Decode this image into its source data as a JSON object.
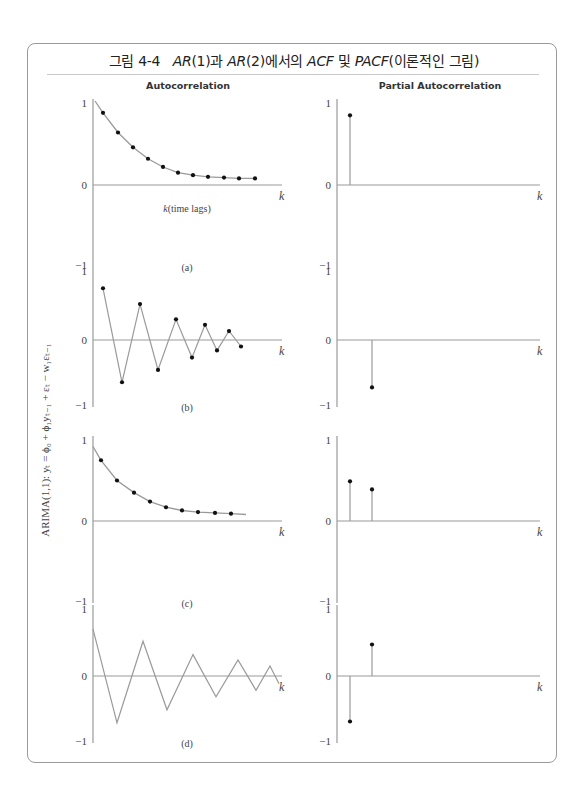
{
  "figure": {
    "title_prefix": "그림 4-4",
    "title_parts": [
      "AR",
      "(1)과 ",
      "AR",
      "(2)에서의 ",
      "ACF",
      " 및 ",
      "PACF",
      "(이론적인 그림)"
    ],
    "column_headers": [
      "Autocorrelation",
      "Partial Autocorrelation"
    ],
    "side_label": "ARIMA(1,1): yₜ = ϕ₀ + ϕ₁yₜ₋₁ + εₜ − w₁εₜ₋₁",
    "x_axis_label": "k(time lags)",
    "k_label": "k",
    "colors": {
      "line": "#9a9a9a",
      "dot": "#111111",
      "axis": "#9a9a9a",
      "frame": "#9a9a9a"
    }
  },
  "chart_data": [
    {
      "panel": "(a)",
      "column": "Autocorrelation",
      "type": "line",
      "x": [
        1,
        2,
        3,
        4,
        5,
        6,
        7,
        8,
        9,
        10,
        11
      ],
      "values": [
        0.88,
        0.64,
        0.46,
        0.32,
        0.22,
        0.15,
        0.12,
        0.1,
        0.09,
        0.08,
        0.08
      ],
      "markers": true,
      "ylim": [
        -1,
        1
      ],
      "yticks": [
        "1",
        "0",
        "-1"
      ],
      "xlabel": "k(time lags)",
      "caption": "(a)"
    },
    {
      "panel": "(a)",
      "column": "Partial Autocorrelation",
      "type": "stem",
      "x": [
        1
      ],
      "values": [
        0.85
      ],
      "ylim": [
        -1,
        1
      ],
      "yticks": [
        "1",
        "0",
        "-1"
      ]
    },
    {
      "panel": "(b)",
      "column": "Autocorrelation",
      "type": "line",
      "x": [
        1,
        2,
        3,
        4,
        5,
        6,
        7,
        8,
        9,
        10
      ],
      "values": [
        0.75,
        -0.65,
        0.52,
        -0.46,
        0.3,
        -0.27,
        0.22,
        -0.16,
        0.13,
        -0.1
      ],
      "markers": true,
      "ylim": [
        -1,
        1
      ],
      "yticks": [
        "1",
        "0",
        "-1"
      ],
      "caption": "(b)"
    },
    {
      "panel": "(b)",
      "column": "Partial Autocorrelation",
      "type": "stem",
      "x": [
        2
      ],
      "values": [
        -0.73
      ],
      "ylim": [
        -1,
        1
      ],
      "yticks": [
        "1",
        "0",
        "-1"
      ]
    },
    {
      "panel": "(c)",
      "column": "Autocorrelation",
      "type": "line",
      "x": [
        1,
        2,
        3,
        4,
        5,
        6,
        7,
        8,
        9
      ],
      "values": [
        0.75,
        0.5,
        0.35,
        0.24,
        0.17,
        0.13,
        0.11,
        0.1,
        0.09
      ],
      "markers": true,
      "ylim": [
        -1,
        1
      ],
      "yticks": [
        "1",
        "0",
        "-1"
      ],
      "caption": "(c)"
    },
    {
      "panel": "(c)",
      "column": "Partial Autocorrelation",
      "type": "stem",
      "x": [
        1,
        2
      ],
      "values": [
        0.49,
        0.39
      ],
      "ylim": [
        -1,
        1
      ],
      "yticks": [
        "1",
        "0",
        "-1"
      ]
    },
    {
      "panel": "(d)",
      "column": "Autocorrelation",
      "type": "line",
      "x": [
        0,
        1,
        2,
        3,
        4,
        5,
        6,
        7,
        8,
        9,
        10,
        11
      ],
      "values": [
        0.7,
        -0.72,
        0.52,
        -0.52,
        0.32,
        -0.32,
        0.24,
        -0.22,
        0.15,
        -0.12
      ],
      "markers": false,
      "ylim": [
        -1,
        1
      ],
      "yticks": [
        "1",
        "0",
        "-1"
      ],
      "caption": "(d)"
    },
    {
      "panel": "(d)",
      "column": "Partial Autocorrelation",
      "type": "stem",
      "x": [
        1,
        2
      ],
      "values": [
        -0.7,
        0.47
      ],
      "ylim": [
        -1,
        1
      ],
      "yticks": [
        "1",
        "0",
        "-1"
      ]
    }
  ]
}
